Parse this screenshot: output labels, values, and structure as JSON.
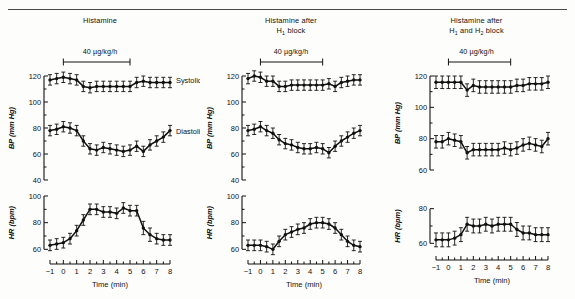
{
  "figure": {
    "x_axis_label": "Time (min)",
    "bp_axis_label": "BP (mm Hg)",
    "hr_axis_label": "HR (bpm)",
    "series_label_systolic": "Systolic",
    "series_label_diastolic": "Diastolic",
    "dose_label": "40 µg/kg/h"
  },
  "panels": [
    {
      "id": "histamine",
      "title_line1": "Histamine",
      "title_line2": ""
    },
    {
      "id": "h1-block",
      "title_line1": "Histamine after",
      "title_line2": "H₁ block"
    },
    {
      "id": "h1-h2-block",
      "title_line1": "Histamine after",
      "title_line2": "H₁ and H₂ block"
    }
  ],
  "chart_data": [
    {
      "type": "line",
      "title": "Histamine",
      "panel": "bp",
      "xlabel": "Time (min)",
      "ylabel": "BP (mm Hg)",
      "xlim": [
        -1,
        8
      ],
      "ylim": [
        40,
        120
      ],
      "yticks": [
        40,
        60,
        80,
        100,
        120
      ],
      "xticks": [
        -1,
        0,
        1,
        2,
        3,
        4,
        5,
        6,
        7,
        8
      ],
      "grid": false,
      "infusion_start": 0,
      "infusion_end": 5,
      "x": [
        -1,
        -0.5,
        0,
        0.5,
        1,
        1.5,
        2,
        2.5,
        3,
        3.5,
        4,
        4.5,
        5,
        5.5,
        6,
        6.5,
        7,
        7.5,
        8
      ],
      "series": [
        {
          "name": "Systolic",
          "values": [
            117,
            118,
            119,
            118,
            117,
            112,
            111,
            112,
            112,
            112,
            112,
            112,
            112,
            115,
            116,
            115,
            115,
            115,
            115
          ],
          "errors": [
            4,
            4,
            4,
            4,
            4,
            4,
            4,
            4,
            4,
            4,
            4,
            4,
            4,
            4,
            4,
            4,
            4,
            4,
            4
          ]
        },
        {
          "name": "Diastolic",
          "values": [
            78,
            79,
            81,
            80,
            78,
            70,
            64,
            63,
            65,
            64,
            63,
            62,
            63,
            66,
            62,
            67,
            70,
            73,
            78
          ],
          "errors": [
            4,
            4,
            4,
            4,
            4,
            4,
            4,
            4,
            4,
            4,
            4,
            4,
            4,
            4,
            4,
            4,
            4,
            4,
            4
          ]
        }
      ]
    },
    {
      "type": "line",
      "title": "Histamine",
      "panel": "hr",
      "xlabel": "Time (min)",
      "ylabel": "HR (bpm)",
      "xlim": [
        -1,
        8
      ],
      "ylim": [
        55,
        100
      ],
      "yticks": [
        60,
        80,
        100
      ],
      "xticks": [
        -1,
        0,
        1,
        2,
        3,
        4,
        5,
        6,
        7,
        8
      ],
      "grid": false,
      "x": [
        -1,
        -0.5,
        0,
        0.5,
        1,
        1.5,
        2,
        2.5,
        3,
        3.5,
        4,
        4.5,
        5,
        5.5,
        6,
        6.5,
        7,
        7.5,
        8
      ],
      "series": [
        {
          "name": "HR",
          "values": [
            63,
            64,
            65,
            68,
            74,
            82,
            90,
            90,
            88,
            88,
            87,
            91,
            89,
            89,
            76,
            71,
            68,
            67,
            67
          ],
          "errors": [
            4,
            4,
            4,
            4,
            4,
            4,
            4,
            4,
            4,
            4,
            4,
            4,
            4,
            4,
            5,
            5,
            4,
            4,
            4
          ]
        }
      ]
    },
    {
      "type": "line",
      "title": "Histamine after H1 block",
      "panel": "bp",
      "xlabel": "Time (min)",
      "ylabel": "BP (mm Hg)",
      "xlim": [
        -1,
        8
      ],
      "ylim": [
        40,
        120
      ],
      "yticks": [
        40,
        60,
        80,
        100,
        120
      ],
      "xticks": [
        -1,
        0,
        1,
        2,
        3,
        4,
        5,
        6,
        7,
        8
      ],
      "grid": false,
      "infusion_start": 0,
      "infusion_end": 5,
      "x": [
        -1,
        -0.5,
        0,
        0.5,
        1,
        1.5,
        2,
        2.5,
        3,
        3.5,
        4,
        4.5,
        5,
        5.5,
        6,
        6.5,
        7,
        7.5,
        8
      ],
      "series": [
        {
          "name": "Systolic",
          "values": [
            118,
            120,
            119,
            116,
            116,
            112,
            112,
            113,
            113,
            113,
            113,
            113,
            113,
            114,
            112,
            115,
            116,
            117,
            117
          ],
          "errors": [
            4,
            4,
            4,
            4,
            4,
            4,
            4,
            4,
            4,
            4,
            4,
            4,
            4,
            4,
            4,
            4,
            4,
            4,
            4
          ]
        },
        {
          "name": "Diastolic",
          "values": [
            78,
            79,
            81,
            78,
            76,
            71,
            68,
            67,
            65,
            64,
            64,
            65,
            64,
            61,
            66,
            70,
            73,
            76,
            78
          ],
          "errors": [
            4,
            4,
            4,
            4,
            4,
            4,
            4,
            4,
            4,
            4,
            4,
            4,
            4,
            4,
            4,
            4,
            4,
            4,
            4
          ]
        }
      ]
    },
    {
      "type": "line",
      "title": "Histamine after H1 block",
      "panel": "hr",
      "xlabel": "Time (min)",
      "ylabel": "HR (bpm)",
      "xlim": [
        55,
        100
      ],
      "ylim": [
        55,
        100
      ],
      "yticks": [
        60,
        80,
        100
      ],
      "xticks": [
        -1,
        0,
        1,
        2,
        3,
        4,
        5,
        6,
        7,
        8
      ],
      "grid": false,
      "x": [
        -1,
        -0.5,
        0,
        0.5,
        1,
        1.5,
        2,
        2.5,
        3,
        3.5,
        4,
        4.5,
        5,
        5.5,
        6,
        6.5,
        7,
        7.5,
        8
      ],
      "series": [
        {
          "name": "HR",
          "values": [
            63,
            63,
            63,
            62,
            60,
            66,
            71,
            73,
            75,
            76,
            79,
            80,
            80,
            79,
            76,
            71,
            66,
            63,
            62
          ],
          "errors": [
            4,
            4,
            4,
            4,
            4,
            4,
            4,
            4,
            4,
            4,
            4,
            4,
            4,
            4,
            4,
            4,
            4,
            4,
            4
          ]
        }
      ]
    },
    {
      "type": "line",
      "title": "Histamine after H1 and H2 block",
      "panel": "bp",
      "xlabel": "Time (min)",
      "ylabel": "BP (mm Hg)",
      "xlim": [
        -1,
        8
      ],
      "ylim": [
        60,
        120
      ],
      "yticks": [
        60,
        80,
        100,
        120
      ],
      "xticks": [
        -1,
        0,
        1,
        2,
        3,
        4,
        5,
        6,
        7,
        8
      ],
      "grid": false,
      "infusion_start": 0,
      "infusion_end": 5,
      "x": [
        -1,
        -0.5,
        0,
        0.5,
        1,
        1.5,
        2,
        2.5,
        3,
        3.5,
        4,
        4.5,
        5,
        5.5,
        6,
        6.5,
        7,
        7.5,
        8
      ],
      "series": [
        {
          "name": "Systolic",
          "values": [
            116,
            116,
            116,
            116,
            116,
            111,
            114,
            113,
            113,
            113,
            113,
            113,
            113,
            114,
            114,
            115,
            115,
            115,
            116
          ],
          "errors": [
            4,
            4,
            4,
            4,
            4,
            4,
            4,
            4,
            4,
            4,
            4,
            4,
            4,
            4,
            4,
            4,
            4,
            4,
            4
          ]
        },
        {
          "name": "Diastolic",
          "values": [
            78,
            78,
            80,
            79,
            78,
            71,
            73,
            73,
            73,
            73,
            73,
            74,
            73,
            74,
            76,
            77,
            76,
            75,
            80
          ],
          "errors": [
            4,
            4,
            4,
            4,
            4,
            4,
            4,
            4,
            4,
            4,
            4,
            4,
            4,
            4,
            4,
            4,
            4,
            4,
            4
          ]
        }
      ]
    },
    {
      "type": "line",
      "title": "Histamine after H1 and H2 block",
      "panel": "hr",
      "xlabel": "Time (min)",
      "ylabel": "HR (bpm)",
      "xlim": [
        -1,
        8
      ],
      "ylim": [
        55,
        85
      ],
      "yticks": [
        60,
        80
      ],
      "xticks": [
        -1,
        0,
        1,
        2,
        3,
        4,
        5,
        6,
        7,
        8
      ],
      "grid": false,
      "x": [
        -1,
        -0.5,
        0,
        0.5,
        1,
        1.5,
        2,
        2.5,
        3,
        3.5,
        4,
        4.5,
        5,
        5.5,
        6,
        6.5,
        7,
        7.5,
        8
      ],
      "series": [
        {
          "name": "HR",
          "values": [
            62,
            62,
            62,
            63,
            65,
            71,
            70,
            70,
            71,
            70,
            71,
            71,
            71,
            68,
            66,
            66,
            65,
            65,
            65
          ],
          "errors": [
            4,
            4,
            4,
            4,
            4,
            4,
            4,
            4,
            4,
            4,
            4,
            4,
            4,
            4,
            4,
            4,
            4,
            4,
            4
          ]
        }
      ]
    }
  ]
}
